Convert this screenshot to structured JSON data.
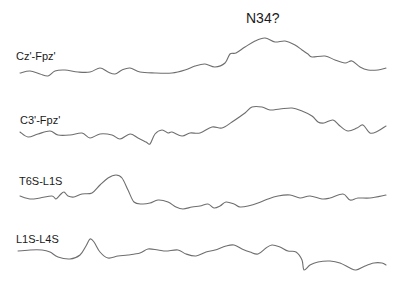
{
  "chart_data": {
    "type": "line",
    "title": "",
    "xlabel": "",
    "ylabel": "",
    "grid": false,
    "legend": "none (channel labels placed above each trace)",
    "annotations": [
      {
        "text": "N34?",
        "x": 265,
        "y": 18,
        "attached_to": "Cz'-Fpz'"
      }
    ],
    "series": [
      {
        "name": "Cz'-Fpz'",
        "points": [
          [
            20,
            73
          ],
          [
            30,
            71
          ],
          [
            40,
            74
          ],
          [
            48,
            76
          ],
          [
            55,
            71
          ],
          [
            65,
            70
          ],
          [
            78,
            72
          ],
          [
            90,
            72
          ],
          [
            100,
            68
          ],
          [
            108,
            72
          ],
          [
            115,
            74
          ],
          [
            122,
            70
          ],
          [
            130,
            68
          ],
          [
            140,
            72
          ],
          [
            155,
            73
          ],
          [
            172,
            73
          ],
          [
            185,
            70
          ],
          [
            195,
            66
          ],
          [
            205,
            64
          ],
          [
            215,
            67
          ],
          [
            225,
            63
          ],
          [
            230,
            54
          ],
          [
            236,
            53
          ],
          [
            245,
            47
          ],
          [
            255,
            41
          ],
          [
            265,
            38
          ],
          [
            275,
            42
          ],
          [
            285,
            41
          ],
          [
            295,
            45
          ],
          [
            302,
            50
          ],
          [
            308,
            54
          ],
          [
            312,
            57
          ],
          [
            325,
            56
          ],
          [
            335,
            60
          ],
          [
            345,
            63
          ],
          [
            352,
            61
          ],
          [
            360,
            67
          ],
          [
            368,
            70
          ],
          [
            378,
            70
          ],
          [
            386,
            68
          ]
        ]
      },
      {
        "name": "C3'-Fpz'",
        "points": [
          [
            20,
            132
          ],
          [
            28,
            137
          ],
          [
            38,
            134
          ],
          [
            50,
            131
          ],
          [
            58,
            135
          ],
          [
            70,
            135
          ],
          [
            82,
            133
          ],
          [
            90,
            138
          ],
          [
            100,
            134
          ],
          [
            112,
            135
          ],
          [
            120,
            139
          ],
          [
            130,
            134
          ],
          [
            138,
            138
          ],
          [
            146,
            142
          ],
          [
            150,
            144
          ],
          [
            155,
            134
          ],
          [
            162,
            130
          ],
          [
            168,
            133
          ],
          [
            172,
            132
          ],
          [
            182,
            136
          ],
          [
            190,
            133
          ],
          [
            200,
            133
          ],
          [
            212,
            127
          ],
          [
            222,
            128
          ],
          [
            232,
            122
          ],
          [
            245,
            113
          ],
          [
            252,
            107
          ],
          [
            262,
            107
          ],
          [
            270,
            110
          ],
          [
            280,
            109
          ],
          [
            292,
            108
          ],
          [
            302,
            111
          ],
          [
            312,
            116
          ],
          [
            318,
            122
          ],
          [
            324,
            123
          ],
          [
            333,
            120
          ],
          [
            340,
            126
          ],
          [
            348,
            131
          ],
          [
            357,
            128
          ],
          [
            363,
            125
          ],
          [
            370,
            133
          ],
          [
            378,
            131
          ],
          [
            386,
            126
          ]
        ]
      },
      {
        "name": "T6S-L1S",
        "points": [
          [
            20,
            196
          ],
          [
            30,
            199
          ],
          [
            40,
            198
          ],
          [
            52,
            196
          ],
          [
            56,
            199
          ],
          [
            60,
            195
          ],
          [
            64,
            192
          ],
          [
            68,
            196
          ],
          [
            74,
            197
          ],
          [
            82,
            194
          ],
          [
            92,
            193
          ],
          [
            100,
            185
          ],
          [
            108,
            178
          ],
          [
            116,
            175
          ],
          [
            122,
            178
          ],
          [
            128,
            190
          ],
          [
            134,
            202
          ],
          [
            142,
            204
          ],
          [
            150,
            203
          ],
          [
            158,
            200
          ],
          [
            168,
            202
          ],
          [
            176,
            207
          ],
          [
            183,
            209
          ],
          [
            192,
            207
          ],
          [
            200,
            206
          ],
          [
            208,
            204
          ],
          [
            214,
            208
          ],
          [
            220,
            206
          ],
          [
            226,
            202
          ],
          [
            234,
            204
          ],
          [
            240,
            207
          ],
          [
            248,
            206
          ],
          [
            258,
            203
          ],
          [
            268,
            199
          ],
          [
            278,
            196
          ],
          [
            290,
            195
          ],
          [
            300,
            198
          ],
          [
            310,
            196
          ],
          [
            322,
            199
          ],
          [
            330,
            198
          ],
          [
            343,
            194
          ],
          [
            350,
            200
          ],
          [
            358,
            198
          ],
          [
            370,
            198
          ],
          [
            386,
            195
          ]
        ]
      },
      {
        "name": "L1S-L4S",
        "points": [
          [
            18,
            251
          ],
          [
            30,
            250
          ],
          [
            42,
            250
          ],
          [
            50,
            252
          ],
          [
            58,
            257
          ],
          [
            70,
            259
          ],
          [
            80,
            255
          ],
          [
            86,
            246
          ],
          [
            90,
            239
          ],
          [
            94,
            242
          ],
          [
            100,
            252
          ],
          [
            108,
            258
          ],
          [
            118,
            256
          ],
          [
            128,
            255
          ],
          [
            140,
            253
          ],
          [
            148,
            249
          ],
          [
            158,
            250
          ],
          [
            166,
            251
          ],
          [
            178,
            250
          ],
          [
            186,
            254
          ],
          [
            196,
            256
          ],
          [
            206,
            252
          ],
          [
            215,
            250
          ],
          [
            226,
            246
          ],
          [
            234,
            245
          ],
          [
            242,
            249
          ],
          [
            250,
            252
          ],
          [
            258,
            254
          ],
          [
            266,
            248
          ],
          [
            272,
            245
          ],
          [
            280,
            247
          ],
          [
            288,
            251
          ],
          [
            296,
            252
          ],
          [
            302,
            260
          ],
          [
            304,
            270
          ],
          [
            310,
            265
          ],
          [
            318,
            262
          ],
          [
            330,
            261
          ],
          [
            340,
            263
          ],
          [
            350,
            268
          ],
          [
            356,
            270
          ],
          [
            365,
            266
          ],
          [
            374,
            263
          ],
          [
            382,
            263
          ],
          [
            386,
            265
          ]
        ]
      }
    ],
    "ylim": [
      0,
      284
    ],
    "xlim": [
      0,
      400
    ]
  },
  "labels": {
    "annotation": "N34?",
    "channels": [
      "Cz'-Fpz'",
      "C3'-Fpz'",
      "T6S-L1S",
      "L1S-L4S"
    ]
  }
}
